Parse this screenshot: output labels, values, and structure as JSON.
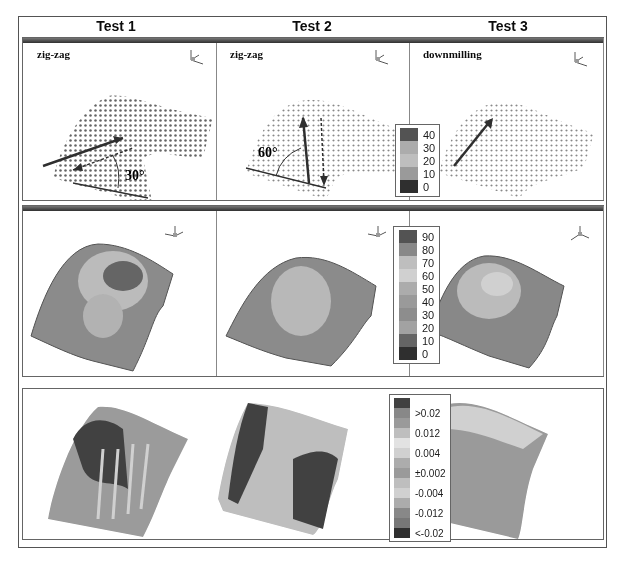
{
  "figure": {
    "columns": [
      {
        "title": "Test 1",
        "strategy": "zig-zag",
        "angle_label": "30°"
      },
      {
        "title": "Test 2",
        "strategy": "zig-zag",
        "angle_label": "60°"
      },
      {
        "title": "Test 3",
        "strategy": "downmilling",
        "angle_label": ""
      }
    ],
    "rows": [
      {
        "name": "tool-path-point-clouds",
        "legend": [
          "40",
          "30",
          "20",
          "10",
          "0"
        ]
      },
      {
        "name": "surface-colormaps",
        "legend": [
          "90",
          "80",
          "70",
          "60",
          "50",
          "40",
          "30",
          "20",
          "10",
          "0"
        ]
      },
      {
        "name": "deviation-maps",
        "legend": [
          ">0.02",
          "0.012",
          "0.004",
          "±0.002",
          "-0.004",
          "-0.012",
          "<-0.02"
        ]
      }
    ],
    "axis_labels": {
      "x": "X",
      "y": "Y",
      "z": "Z"
    }
  }
}
